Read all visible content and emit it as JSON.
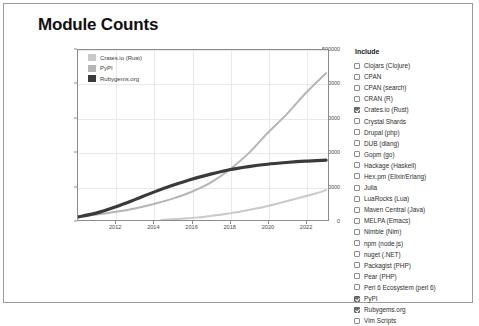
{
  "header": {
    "title": "Module Counts"
  },
  "include_panel": {
    "heading": "Include",
    "items": [
      {
        "label": "Clojars (Clojure)",
        "checked": false
      },
      {
        "label": "CPAN",
        "checked": false
      },
      {
        "label": "CPAN (search)",
        "checked": false
      },
      {
        "label": "CRAN (R)",
        "checked": false
      },
      {
        "label": "Crates.io (Rust)",
        "checked": true
      },
      {
        "label": "Crystal Shards",
        "checked": false
      },
      {
        "label": "Drupal (php)",
        "checked": false
      },
      {
        "label": "DUB (dlang)",
        "checked": false
      },
      {
        "label": "Gopm (go)",
        "checked": false
      },
      {
        "label": "Hackage (Haskell)",
        "checked": false
      },
      {
        "label": "Hex.pm (Elixir/Erlang)",
        "checked": false
      },
      {
        "label": "Julia",
        "checked": false
      },
      {
        "label": "LuaRocks (Lua)",
        "checked": false
      },
      {
        "label": "Maven Central (Java)",
        "checked": false
      },
      {
        "label": "MELPA (Emacs)",
        "checked": false
      },
      {
        "label": "Nimble (Nim)",
        "checked": false
      },
      {
        "label": "npm (node.js)",
        "checked": false
      },
      {
        "label": "nuget (.NET)",
        "checked": false
      },
      {
        "label": "Packagist (PHP)",
        "checked": false
      },
      {
        "label": "Pear (PHP)",
        "checked": false
      },
      {
        "label": "Perl 6 Ecosystem (perl 6)",
        "checked": false
      },
      {
        "label": "PyPI",
        "checked": true
      },
      {
        "label": "Rubygems.org",
        "checked": true
      },
      {
        "label": "Vim Scripts",
        "checked": false
      }
    ]
  },
  "chart_data": {
    "type": "line",
    "title": "Module Counts",
    "xlabel": "",
    "ylabel": "",
    "xlim": [
      2010.0,
      2023.2
    ],
    "ylim": [
      0,
      500000
    ],
    "grid": true,
    "legend_position": "top-left",
    "xticks": [
      "2012",
      "2014",
      "2016",
      "2018",
      "2020",
      "2022"
    ],
    "xtick_values": [
      2012,
      2014,
      2016,
      2018,
      2020,
      2022
    ],
    "yticks": [
      "0",
      "100000",
      "200000",
      "300000",
      "400000",
      "500000"
    ],
    "ytick_values": [
      0,
      100000,
      200000,
      300000,
      400000,
      500000
    ],
    "series": [
      {
        "name": "Crates.io (Rust)",
        "color": "#c9c9c9",
        "width": 2.0,
        "x": [
          2014.4,
          2015.0,
          2015.6,
          2016.2,
          2016.8,
          2017.4,
          2018.0,
          2018.6,
          2019.2,
          2019.8,
          2020.4,
          2021.0,
          2021.6,
          2022.2,
          2022.8,
          2023.1
        ],
        "y": [
          300,
          2000,
          4200,
          7000,
          10500,
          14500,
          19500,
          25000,
          31500,
          38500,
          46500,
          55000,
          64000,
          73000,
          82000,
          88000
        ]
      },
      {
        "name": "PyPI",
        "color": "#b5b5b5",
        "width": 2.0,
        "x": [
          2010.0,
          2011.0,
          2012.0,
          2013.0,
          2014.0,
          2015.0,
          2016.0,
          2017.0,
          2018.0,
          2019.0,
          2020.0,
          2021.0,
          2022.0,
          2022.6,
          2023.1
        ],
        "y": [
          10000,
          16000,
          24000,
          34000,
          47000,
          63000,
          83000,
          110000,
          148000,
          196000,
          255000,
          310000,
          372000,
          405000,
          432000
        ]
      },
      {
        "name": "Rubygems.org",
        "color": "#3a3a3a",
        "width": 3.2,
        "x": [
          2010.0,
          2011.0,
          2012.0,
          2013.0,
          2014.0,
          2015.0,
          2016.0,
          2017.0,
          2018.0,
          2019.0,
          2020.0,
          2021.0,
          2022.0,
          2023.1
        ],
        "y": [
          9000,
          21000,
          39000,
          60000,
          82000,
          102000,
          120000,
          135000,
          148000,
          157000,
          164000,
          169000,
          173000,
          176000
        ]
      }
    ]
  }
}
